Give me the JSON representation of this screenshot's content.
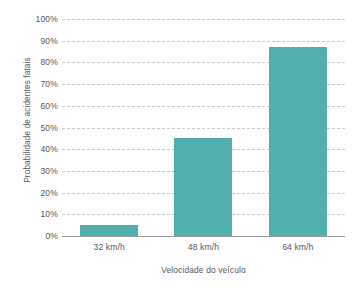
{
  "chart_data": {
    "type": "bar",
    "title": "",
    "subtitle": "",
    "categories": [
      "32 km/h",
      "48 km/h",
      "64 km/h"
    ],
    "values": [
      5,
      45,
      87
    ],
    "value_labels": [
      "5%",
      "45%",
      "87%"
    ],
    "xlabel": "Velocidade do veículo",
    "ylabel": "Probabilidade de acidentes fatais",
    "ylim": [
      0,
      100
    ],
    "ytick_values": [
      100,
      90,
      80,
      70,
      60,
      50,
      40,
      30,
      20,
      10,
      0
    ],
    "ytick_labels": [
      "100%",
      "90%",
      "80%",
      "70%",
      "60%",
      "50%",
      "40%",
      "30%",
      "20%",
      "10%",
      "0%"
    ],
    "grid": true,
    "grid_axis": "y",
    "grid_style": "dashed",
    "legend": false,
    "legend_position": "none",
    "series": [
      {
        "name": "Probabilidade de acidentes fatais",
        "values": [
          5,
          45,
          87
        ],
        "color": "#51afae"
      }
    ]
  },
  "colors": {
    "bar": "#51afae",
    "gridline": "#c9c9c9",
    "axis_line": "#9a9a9a",
    "text": "#58595b",
    "background": "#ffffff"
  }
}
